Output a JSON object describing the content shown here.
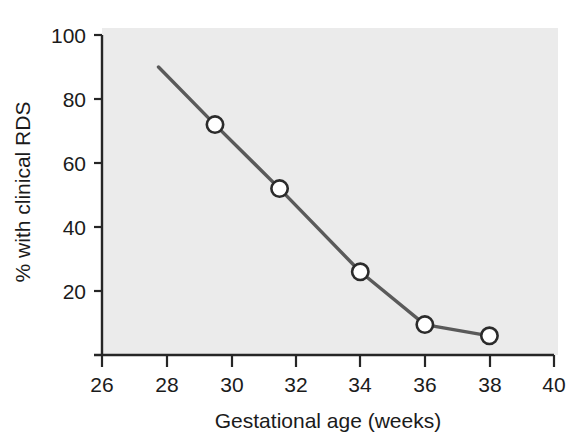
{
  "chart_data": {
    "type": "line",
    "title": "",
    "xlabel": "Gestational age (weeks)",
    "ylabel": "% with clinical RDS",
    "xlim": [
      26,
      40
    ],
    "ylim": [
      0,
      100
    ],
    "xticks": [
      26,
      28,
      30,
      32,
      34,
      36,
      38,
      40
    ],
    "yticks": [
      20,
      40,
      60,
      80,
      100
    ],
    "xtick_labels": [
      "26",
      "28",
      "30",
      "32",
      "34",
      "36",
      "38",
      "40"
    ],
    "ytick_labels": [
      "20",
      "40",
      "60",
      "80",
      "100"
    ],
    "grid": false,
    "legend": "none",
    "series": [
      {
        "name": "% with clinical RDS",
        "x": [
          27.75,
          29.5,
          31.5,
          34,
          36,
          38
        ],
        "values": [
          90,
          72,
          52,
          26,
          9.5,
          6
        ],
        "marker": "open-circle",
        "line_color": "#5a5a5a",
        "marker_face_color": "#ffffff",
        "marker_edge_color": "#2b2b2b"
      }
    ],
    "marker_points": [
      {
        "x": 29.5,
        "y": 72
      },
      {
        "x": 31.5,
        "y": 52
      },
      {
        "x": 34,
        "y": 26
      },
      {
        "x": 36,
        "y": 9.5
      },
      {
        "x": 38,
        "y": 6
      }
    ],
    "colors": {
      "panel_background": "#ebebeb",
      "figure_background": "#ffffff",
      "axis": "#262626",
      "text": "#1b1b1b",
      "line": "#5a5a5a"
    }
  }
}
